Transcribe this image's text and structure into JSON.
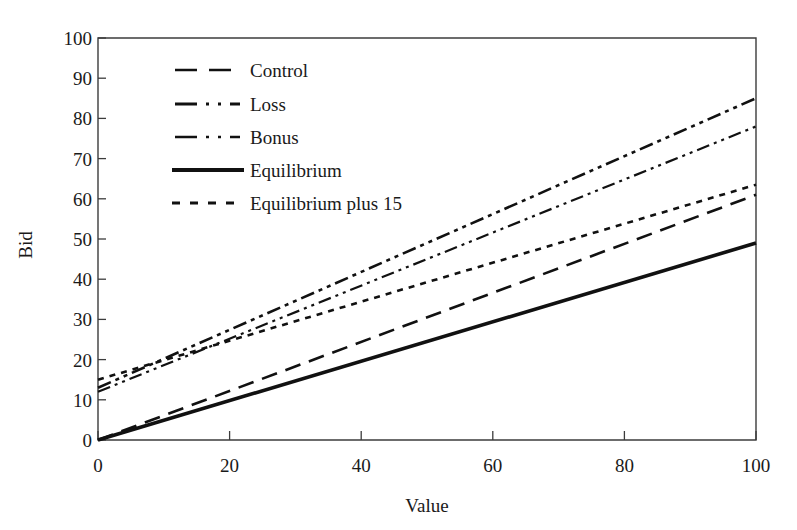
{
  "figure": {
    "background_color": "#ffffff",
    "line_color": "#111111",
    "axis_color": "#3c3c3c"
  },
  "axes": {
    "x_title": "Value",
    "y_title": "Bid",
    "x_ticks": [
      "0",
      "20",
      "40",
      "60",
      "80",
      "100"
    ],
    "y_ticks": [
      "0",
      "10",
      "20",
      "30",
      "40",
      "50",
      "60",
      "70",
      "80",
      "90",
      "100"
    ]
  },
  "legend": {
    "entries": [
      {
        "label": "Control",
        "style": "long-dash"
      },
      {
        "label": "Loss",
        "style": "dash-dot-dot"
      },
      {
        "label": "Bonus",
        "style": "dash-dot-dot-thin"
      },
      {
        "label": "Equilibrium",
        "style": "solid-thick"
      },
      {
        "label": "Equilibrium plus 15",
        "style": "dotted"
      }
    ]
  },
  "chart_data": {
    "type": "line",
    "title": "",
    "xlabel": "Value",
    "ylabel": "Bid",
    "xlim": [
      0,
      100
    ],
    "ylim": [
      0,
      100
    ],
    "xticks": [
      0,
      20,
      40,
      60,
      80,
      100
    ],
    "yticks": [
      0,
      10,
      20,
      30,
      40,
      50,
      60,
      70,
      80,
      90,
      100
    ],
    "grid": false,
    "legend_position": "upper-left-inside",
    "series": [
      {
        "name": "Control",
        "style": "long-dash",
        "stroke_width": 2.6,
        "dasharray": "16 9",
        "x": [
          0,
          100
        ],
        "y": [
          0,
          61
        ],
        "intercept": 0,
        "slope": 0.61
      },
      {
        "name": "Loss",
        "style": "dash-dot-dot",
        "stroke_width": 2.6,
        "dasharray": "14 5 4 5 4 5",
        "x": [
          0,
          100
        ],
        "y": [
          13,
          85
        ],
        "intercept": 13,
        "slope": 0.72
      },
      {
        "name": "Bonus",
        "style": "dash-dot-dot-thin",
        "stroke_width": 2.2,
        "dasharray": "13 5 3 5 3 5",
        "x": [
          0,
          100
        ],
        "y": [
          12,
          78
        ],
        "intercept": 12,
        "slope": 0.66
      },
      {
        "name": "Equilibrium",
        "style": "solid-thick",
        "stroke_width": 3.6,
        "dasharray": "none",
        "x": [
          0,
          100
        ],
        "y": [
          0,
          49
        ],
        "intercept": 0,
        "slope": 0.49
      },
      {
        "name": "Equilibrium plus 15",
        "style": "dotted",
        "stroke_width": 2.6,
        "dasharray": "6 6",
        "x": [
          0,
          100
        ],
        "y": [
          15,
          63.5
        ],
        "intercept": 15,
        "slope": 0.485
      }
    ]
  }
}
